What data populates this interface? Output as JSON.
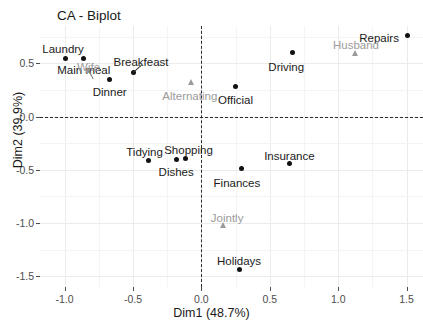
{
  "chart_data": {
    "type": "scatter",
    "title": "CA - Biplot",
    "xlabel": "Dim1 (48.7%)",
    "ylabel": "Dim2 (39.9%)",
    "xlim": [
      -1.18,
      1.62
    ],
    "ylim": [
      -1.6,
      0.85
    ],
    "xticks": [
      -1.0,
      -0.5,
      0.0,
      0.5,
      1.0,
      1.5
    ],
    "xticklabels": [
      "-1.0",
      "-0.5",
      "0.0",
      "0.5",
      "1.0",
      "1.5"
    ],
    "yticks": [
      0.5,
      0.0,
      -0.5,
      -1.0,
      -1.5
    ],
    "yticklabels": [
      "0.5",
      "0.0",
      "-0.5",
      "-1.0",
      "-1.5"
    ],
    "grid": true,
    "legend": "none",
    "reference_lines": [
      {
        "orientation": "vertical",
        "value": 0.0,
        "style": "dashed"
      },
      {
        "orientation": "horizontal",
        "value": 0.0,
        "style": "dashed"
      }
    ],
    "series": [
      {
        "name": "Tasks (rows)",
        "marker": "circle",
        "color": "#111111",
        "points": [
          {
            "label": "Laundry",
            "x": -0.995,
            "y": 0.545,
            "label_dx": -2,
            "label_dy": -9,
            "anchor": "middle"
          },
          {
            "label": "Main meal",
            "x": -0.86,
            "y": 0.545,
            "label_dx": 0,
            "label_dy": 12,
            "anchor": "middle"
          },
          {
            "label": "Dinner",
            "x": -0.67,
            "y": 0.35,
            "label_dx": 0,
            "label_dy": 13,
            "anchor": "middle"
          },
          {
            "label": "Breakfeast",
            "x": -0.5,
            "y": 0.415,
            "label_dx": 8,
            "label_dy": -10,
            "anchor": "middle"
          },
          {
            "label": "Tidying",
            "x": -0.385,
            "y": -0.41,
            "label_dx": -4,
            "label_dy": -8,
            "anchor": "middle"
          },
          {
            "label": "Dishes",
            "x": -0.185,
            "y": -0.4,
            "label_dx": 0,
            "label_dy": 13,
            "anchor": "middle"
          },
          {
            "label": "Shopping",
            "x": -0.115,
            "y": -0.395,
            "label_dx": 3,
            "label_dy": -9,
            "anchor": "middle"
          },
          {
            "label": "Official",
            "x": 0.25,
            "y": 0.285,
            "label_dx": 0,
            "label_dy": 14,
            "anchor": "middle"
          },
          {
            "label": "Finances",
            "x": 0.29,
            "y": -0.49,
            "label_dx": -4,
            "label_dy": 14,
            "anchor": "middle"
          },
          {
            "label": "Insurance",
            "x": 0.645,
            "y": -0.445,
            "label_dx": 0,
            "label_dy": -8,
            "anchor": "middle"
          },
          {
            "label": "Driving",
            "x": 0.665,
            "y": 0.6,
            "label_dx": -6,
            "label_dy": 14,
            "anchor": "middle"
          },
          {
            "label": "Holidays",
            "x": 0.275,
            "y": -1.435,
            "label_dx": 0,
            "label_dy": -8,
            "anchor": "middle"
          },
          {
            "label": "Repairs",
            "x": 1.505,
            "y": 0.765,
            "label_dx": -8,
            "label_dy": 3,
            "anchor": "end"
          }
        ]
      },
      {
        "name": "Performers (columns)",
        "marker": "triangle",
        "color": "#9a9a9a",
        "points": [
          {
            "label": "Wife",
            "x": -0.825,
            "y": 0.44,
            "label_dx": 0,
            "label_dy": -3,
            "anchor": "middle"
          },
          {
            "label": "Alternating",
            "x": -0.07,
            "y": 0.32,
            "label_dx": -2,
            "label_dy": 14,
            "anchor": "middle"
          },
          {
            "label": "Husband",
            "x": 1.13,
            "y": 0.6,
            "label_dx": 0,
            "label_dy": -8,
            "anchor": "middle"
          },
          {
            "label": "Jointly",
            "x": 0.16,
            "y": -1.02,
            "label_dx": 4,
            "label_dy": -7,
            "anchor": "middle"
          }
        ]
      }
    ]
  }
}
